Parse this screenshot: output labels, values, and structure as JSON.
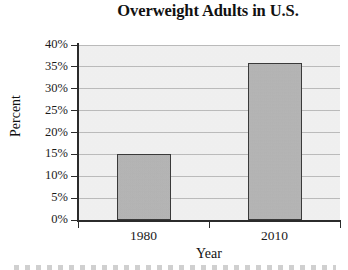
{
  "chart_data": {
    "type": "bar",
    "title": "Overweight Adults in U.S.",
    "xlabel": "Year",
    "ylabel": "Percent",
    "categories": [
      "1980",
      "2010"
    ],
    "values": [
      15,
      36
    ],
    "value_labels": [
      "15%",
      "36%"
    ],
    "ylim": [
      0,
      40
    ],
    "ytick_values": [
      0,
      5,
      10,
      15,
      20,
      25,
      30,
      35,
      40
    ],
    "ytick_labels": [
      "0%",
      "5%",
      "10%",
      "15%",
      "20%",
      "25%",
      "30%",
      "35%",
      "40%"
    ],
    "grid": true,
    "grid_axis": "y",
    "legend": false,
    "legend_position": "none",
    "bar_fill_color": "#b9b9b9",
    "bar_edge_color": "#3a3a3a",
    "plot_background_color": "#f3f3f3",
    "gridline_color": "#bdbdbd",
    "axis_color": "#2b2b2b",
    "text_color": "#1a1a1a"
  }
}
